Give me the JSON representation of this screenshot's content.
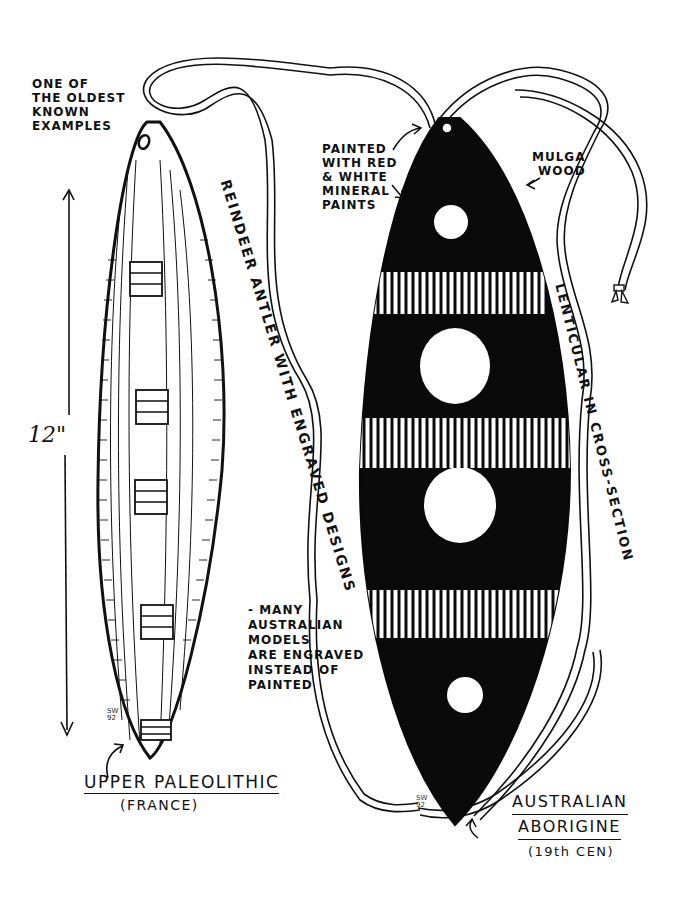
{
  "illustration": {
    "left_artifact": {
      "name": "Upper Paleolithic bullroarer",
      "note_lines": [
        "ONE OF",
        "THE OLDEST",
        "KNOWN",
        "EXAMPLES"
      ],
      "material_label": "REINDEER ANTLER WITH ENGRAVED DESIGNS",
      "dimension": "12\"",
      "period_label": "UPPER PALEOLITHIC",
      "origin_label": "(FRANCE)",
      "signature_lines": [
        "SW",
        "92"
      ]
    },
    "right_artifact": {
      "name": "Australian Aborigine bullroarer",
      "paint_note_lines": [
        "PAINTED",
        "WITH RED",
        "& WHITE",
        "MINERAL",
        "PAINTS"
      ],
      "wood_note_lines": [
        "MULGA",
        "WOOD"
      ],
      "shape_label": "LENTICULAR IN CROSS-SECTION",
      "engraved_note_lines": [
        "- MANY",
        "AUSTRALIAN",
        "MODELS",
        "ARE ENGRAVED",
        "INSTEAD OF",
        "PAINTED"
      ],
      "title_lines": [
        "AUSTRALIAN",
        "ABORIGINE"
      ],
      "era_label": "(19th CEN)",
      "signature_lines": [
        "SW",
        "92"
      ]
    },
    "colors": {
      "ink": "#111111",
      "paper": "#ffffff"
    }
  }
}
